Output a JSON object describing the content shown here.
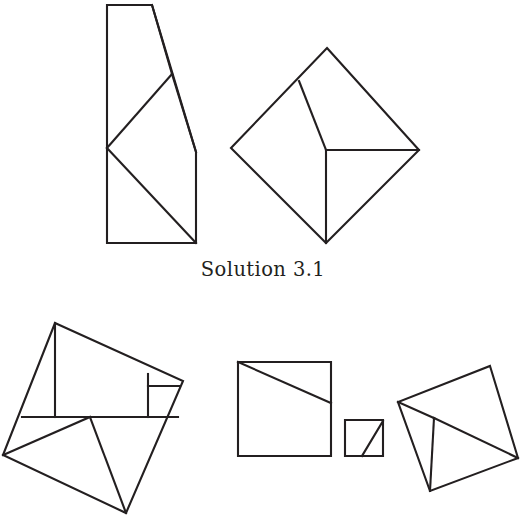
{
  "figure": {
    "caption": "Solution 3.1",
    "caption_position": {
      "x": 204,
      "y": 258
    },
    "background_color": "#ffffff",
    "line_color": "#231f20",
    "line_width": 2.1,
    "width": 526,
    "height": 532
  },
  "diagram_data": {
    "type": "geometric-dissection",
    "title": "Solution 3.1",
    "description": "A geometric dissection diagram in black line art on a white background. The upper row shows a tall polygon dissected by two cut lines beside a tilted square (diamond) dissected into matching pieces. The lower row shows a second dissection: a tilted quadrilateral subdivided into many pieces on the left, a large square with a diagonal cut and a small square with a diagonal cut in the middle, and a tilted square with interior cuts on the right.",
    "groups": [
      {
        "name": "upper-left-polygon",
        "label": "tall polygon with clipped top-right corner",
        "outline": [
          [
            107,
            5
          ],
          [
            152,
            5
          ],
          [
            196,
            152
          ],
          [
            196,
            243
          ],
          [
            107,
            243
          ]
        ],
        "cuts": [
          {
            "name": "cut-upper-vee",
            "points": [
              [
                172,
                74
              ],
              [
                107,
                148
              ]
            ]
          },
          {
            "name": "cut-lower-diagonal",
            "points": [
              [
                107,
                148
              ],
              [
                196,
                243
              ]
            ]
          },
          {
            "name": "cut-right-edge-upper",
            "points": [
              [
                152,
                5
              ],
              [
                172,
                74
              ]
            ]
          },
          {
            "name": "cut-to-right-corner",
            "points": [
              [
                172,
                74
              ],
              [
                196,
                152
              ]
            ]
          }
        ],
        "piece_count": 3
      },
      {
        "name": "upper-right-diamond",
        "label": "tilted square (diamond) target figure",
        "outline": [
          [
            327,
            48
          ],
          [
            419,
            150
          ],
          [
            326,
            243
          ],
          [
            231,
            148
          ]
        ],
        "cuts": [
          {
            "name": "cut-left-upper",
            "points": [
              [
                299,
                81
              ],
              [
                326,
                150
              ]
            ]
          },
          {
            "name": "cut-center-to-right",
            "points": [
              [
                326,
                150
              ],
              [
                419,
                150
              ]
            ]
          },
          {
            "name": "cut-center-to-bottom",
            "points": [
              [
                326,
                150
              ],
              [
                326,
                243
              ]
            ]
          }
        ],
        "piece_count": 4
      },
      {
        "name": "lower-left-quadrilateral",
        "label": "tilted quadrilateral dissected into several pieces",
        "outline": [
          [
            55,
            323
          ],
          [
            183,
            381
          ],
          [
            126,
            513
          ],
          [
            3,
            455
          ]
        ],
        "cuts": [
          {
            "name": "cut-horizontal-band",
            "points": [
              [
                22,
                417
              ],
              [
                178,
                417
              ]
            ]
          },
          {
            "name": "cut-vertical-left",
            "points": [
              [
                55,
                323
              ],
              [
                55,
                417
              ]
            ]
          },
          {
            "name": "cut-vertical-right",
            "points": [
              [
                148,
                374
              ],
              [
                148,
                417
              ]
            ]
          },
          {
            "name": "cut-small-square-top",
            "points": [
              [
                148,
                386
              ],
              [
                180,
                386
              ]
            ]
          },
          {
            "name": "cut-branch-to-left-vertex",
            "points": [
              [
                90,
                417
              ],
              [
                3,
                455
              ]
            ]
          },
          {
            "name": "cut-branch-to-bottom-vertex",
            "points": [
              [
                90,
                417
              ],
              [
                126,
                513
              ]
            ]
          }
        ],
        "piece_count": 6
      },
      {
        "name": "lower-middle-large-square",
        "label": "large square with diagonal cut",
        "outline": [
          [
            238,
            362
          ],
          [
            331,
            362
          ],
          [
            331,
            456
          ],
          [
            238,
            456
          ]
        ],
        "cuts": [
          {
            "name": "cut-diagonal",
            "points": [
              [
                238,
                362
              ],
              [
                331,
                403
              ]
            ]
          }
        ],
        "piece_count": 2
      },
      {
        "name": "lower-middle-small-square",
        "label": "small square with diagonal cut",
        "outline": [
          [
            345,
            420
          ],
          [
            383,
            420
          ],
          [
            383,
            456
          ],
          [
            345,
            456
          ]
        ],
        "cuts": [
          {
            "name": "cut-diagonal",
            "points": [
              [
                383,
                421
              ],
              [
                362,
                456
              ]
            ]
          }
        ],
        "piece_count": 2
      },
      {
        "name": "lower-right-tilted-square",
        "label": "tilted square with interior triangle cuts",
        "outline": [
          [
            490,
            366
          ],
          [
            518,
            458
          ],
          [
            430,
            491
          ],
          [
            398,
            402
          ]
        ],
        "cuts": [
          {
            "name": "cut-left-to-center",
            "points": [
              [
                398,
                402
              ],
              [
                434,
                418
              ]
            ]
          },
          {
            "name": "cut-center-to-bottom",
            "points": [
              [
                434,
                418
              ],
              [
                430,
                491
              ]
            ]
          },
          {
            "name": "cut-center-to-right",
            "points": [
              [
                434,
                418
              ],
              [
                518,
                458
              ]
            ]
          }
        ],
        "piece_count": 4
      }
    ]
  }
}
